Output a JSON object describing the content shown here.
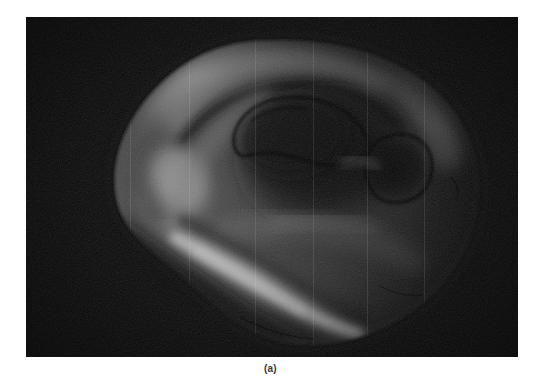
{
  "figure": {
    "caption": "(a)",
    "panel": {
      "label": "ear-image",
      "description": "grayscale ear image with detected edge contours",
      "x": 26,
      "y": 17,
      "width": 492,
      "height": 340,
      "background_color": "#070707",
      "edge_color": "#0a0a0a",
      "highlight_color": "#c8c8c8",
      "midtone_color": "#7d7d7d",
      "shadow_color": "#141414"
    }
  }
}
